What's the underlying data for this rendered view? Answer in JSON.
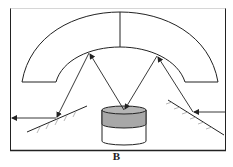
{
  "figure": {
    "label": "B",
    "colors": {
      "line": "#222222",
      "sample_top": "#a8a8a8",
      "hatch": "#999999",
      "background": "#ffffff"
    }
  }
}
